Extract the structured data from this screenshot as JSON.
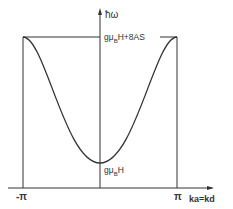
{
  "diagram": {
    "type": "dispersion-curve",
    "y_axis_label": "ħω",
    "x_axis_label": "ka=kd",
    "max_label": "gμBH+8AS",
    "max_label_parts": {
      "pre": "gμ",
      "sub": "B",
      "post": "H+8AS"
    },
    "min_label": "gμBH",
    "min_label_parts": {
      "pre": "gμ",
      "sub": "B",
      "post": "H"
    },
    "x_ticks": [
      "-π",
      "π"
    ],
    "neg_pi_label": "-π",
    "pi_label": "π",
    "colors": {
      "line": "#333333",
      "background": "#ffffff"
    }
  }
}
